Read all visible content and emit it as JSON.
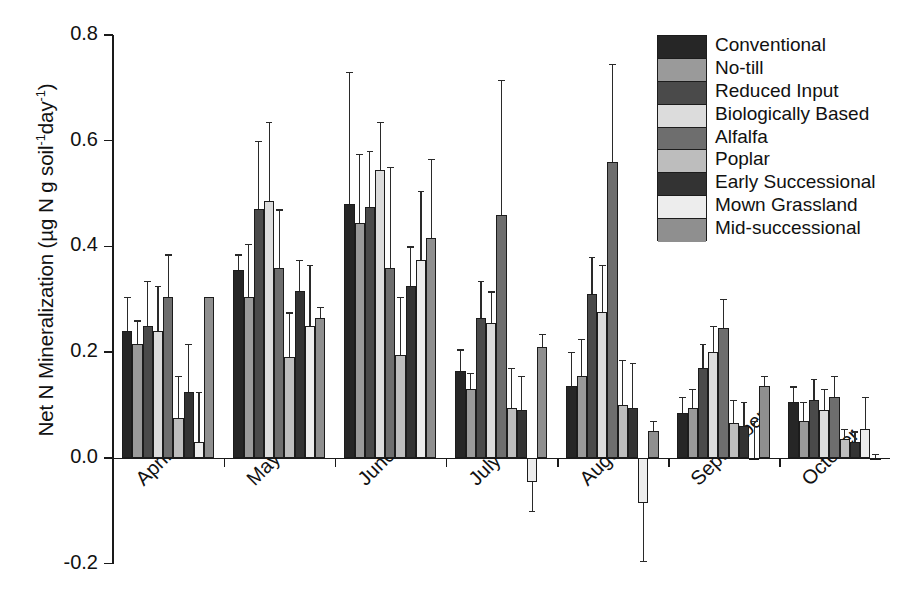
{
  "chart_data": {
    "type": "bar",
    "title": "",
    "xlabel": "",
    "ylabel": "Net N Mineralization (µg N g soil⁻¹day⁻¹)",
    "ylabel_parts": {
      "main": "Net N Mineralization (µg N g soil",
      "sup1": "-1",
      "mid": "day",
      "sup2": "-1",
      "tail": ")"
    },
    "ylim": [
      -0.2,
      0.8
    ],
    "yticks": [
      0.8,
      0.6,
      0.4,
      0.2,
      0.0,
      -0.2
    ],
    "ytick_labels": [
      "0.8",
      "0.6",
      "0.4",
      "0.2",
      "0.0",
      "-0.2"
    ],
    "grid": false,
    "legend_position": "top-right",
    "categories": [
      "April",
      "May",
      "June",
      "July",
      "August",
      "September",
      "October"
    ],
    "series": [
      {
        "name": "Conventional",
        "color": "#262626",
        "values": [
          0.24,
          0.355,
          0.48,
          0.165,
          0.135,
          0.085,
          0.105
        ],
        "errors": [
          0.065,
          0.03,
          0.25,
          0.04,
          0.065,
          0.03,
          0.03
        ]
      },
      {
        "name": "No-till",
        "color": "#9a9a9a",
        "values": [
          0.215,
          0.305,
          0.445,
          0.13,
          0.155,
          0.095,
          0.07
        ],
        "errors": [
          0.045,
          0.1,
          0.13,
          0.03,
          0.07,
          0.035,
          0.035
        ]
      },
      {
        "name": "Reduced Input",
        "color": "#4a4a4a",
        "values": [
          0.25,
          0.47,
          0.475,
          0.265,
          0.31,
          0.17,
          0.11
        ],
        "errors": [
          0.085,
          0.13,
          0.105,
          0.07,
          0.07,
          0.045,
          0.04
        ]
      },
      {
        "name": "Biologically Based",
        "color": "#dcdcdc",
        "values": [
          0.24,
          0.485,
          0.545,
          0.255,
          0.275,
          0.2,
          0.09
        ],
        "errors": [
          0.085,
          0.15,
          0.09,
          0.06,
          0.09,
          0.05,
          0.04
        ]
      },
      {
        "name": "Alfalfa",
        "color": "#6e6e6e",
        "values": [
          0.305,
          0.36,
          0.36,
          0.46,
          0.56,
          0.245,
          0.115
        ],
        "errors": [
          0.08,
          0.11,
          0.19,
          0.255,
          0.185,
          0.055,
          0.04
        ]
      },
      {
        "name": "Poplar",
        "color": "#bdbdbd",
        "values": [
          0.075,
          0.19,
          0.195,
          0.095,
          0.1,
          0.065,
          0.035
        ],
        "errors": [
          0.08,
          0.085,
          0.11,
          0.075,
          0.085,
          0.045,
          0.02
        ]
      },
      {
        "name": "Early Successional",
        "color": "#333333",
        "values": [
          0.125,
          0.315,
          0.325,
          0.09,
          0.095,
          0.06,
          0.03
        ],
        "errors": [
          0.09,
          0.06,
          0.075,
          0.065,
          0.085,
          0.045,
          0.02
        ]
      },
      {
        "name": "Mown Grassland",
        "color": "#ededed",
        "values": [
          0.03,
          0.25,
          0.375,
          -0.045,
          -0.085,
          0.0,
          0.055
        ],
        "errors": [
          0.095,
          0.115,
          0.13,
          0.055,
          0.11,
          0.07,
          0.06
        ]
      },
      {
        "name": "Mid-successional",
        "color": "#8f8f8f",
        "values": [
          0.305,
          0.265,
          0.415,
          0.21,
          0.05,
          0.135,
          0.0
        ],
        "errors": [
          0.0,
          0.02,
          0.15,
          0.025,
          0.02,
          0.02,
          0.008
        ]
      }
    ]
  }
}
